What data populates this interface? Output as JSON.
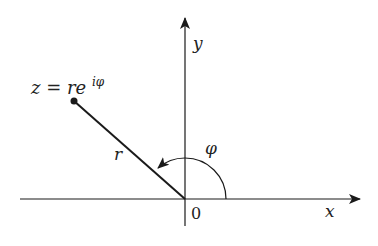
{
  "diagram": {
    "axes": {
      "x_label": "x",
      "y_label": "y",
      "origin_label": "0"
    },
    "point": {
      "label_base": "z = re",
      "label_exponent": "iφ"
    },
    "radius_label": "r",
    "angle_label": "φ",
    "colors": {
      "stroke": "#1a1a1a",
      "background": "#ffffff"
    }
  }
}
